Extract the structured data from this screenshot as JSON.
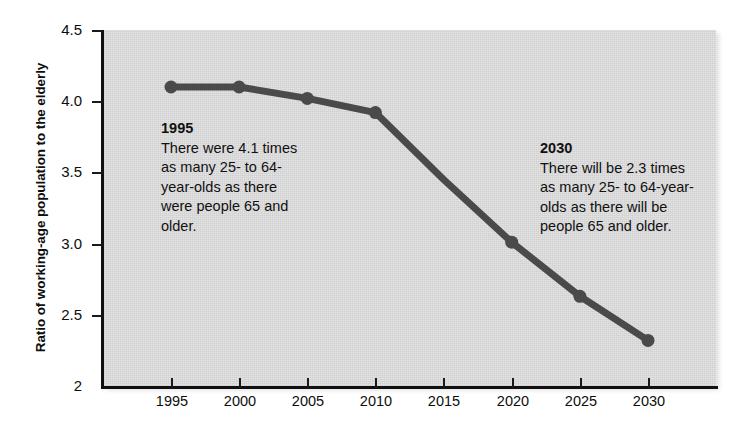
{
  "chart_data": {
    "type": "line",
    "title": "",
    "subtitle": "",
    "xlabel": "",
    "ylabel": "Ratio of working-age population to the elderly",
    "x": [
      1995,
      2000,
      2005,
      2010,
      2015,
      2020,
      2025,
      2030
    ],
    "categories": [
      "1995",
      "2000",
      "2005",
      "2010",
      "2015",
      "2020",
      "2025",
      "2030"
    ],
    "values": [
      4.1,
      4.1,
      4.02,
      3.92,
      3.45,
      3.01,
      2.63,
      2.32
    ],
    "series": [
      {
        "name": "Ratio of working-age population to the elderly",
        "values": [
          4.1,
          4.1,
          4.02,
          3.92,
          3.45,
          3.01,
          2.63,
          2.32
        ],
        "marker_at": [
          true,
          true,
          true,
          true,
          false,
          true,
          true,
          true
        ]
      }
    ],
    "xlim": [
      1995,
      2030
    ],
    "ylim": [
      2,
      4.5
    ],
    "ytick_labels": [
      "4.5",
      "4.0",
      "3.5",
      "3.0",
      "2.5",
      "2"
    ],
    "ytick_values": [
      4.5,
      4.0,
      3.5,
      3.0,
      2.5,
      2.0
    ],
    "xtick_labels": [
      "1995",
      "2000",
      "2005",
      "2010",
      "2015",
      "2020",
      "2025",
      "2030"
    ],
    "grid": false,
    "legend": "none",
    "line_color": "#4a4a4a",
    "marker_color": "#4a4a4a",
    "plot_background": "#d7d7d7",
    "axis_color": "#111111",
    "annotations": [
      {
        "id": "1995",
        "title": "1995",
        "body": "There were 4.1 times as many 25- to 64-year-olds as there were people 65 and older."
      },
      {
        "id": "2030",
        "title": "2030",
        "body": "There will be 2.3 times as many 25- to 64-year-olds as there will be people 65 and older."
      }
    ]
  }
}
